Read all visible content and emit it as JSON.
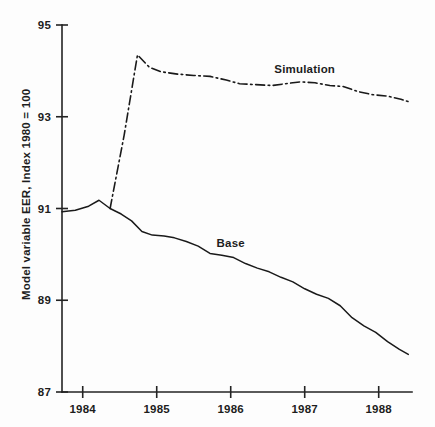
{
  "chart_data": {
    "type": "line",
    "title": "",
    "xlabel": "",
    "ylabel": "Model variable EER, Index 1980 = 100",
    "ylim": [
      87,
      95
    ],
    "xlim": [
      1983.72,
      1988.45
    ],
    "yticks": [
      87,
      89,
      91,
      93,
      95
    ],
    "ytick_labels": [
      "87",
      "89",
      "91",
      "93",
      "95"
    ],
    "xticks": [
      1984,
      1985,
      1986,
      1987,
      1988
    ],
    "xtick_labels": [
      "1984",
      "1985",
      "1986",
      "1987",
      "1988"
    ],
    "grid": false,
    "legend_position": "inline-annotation",
    "series": [
      {
        "name": "Base",
        "style": "solid",
        "label_x": 1986.0,
        "label_y": 90.15,
        "points": [
          [
            1983.72,
            90.93
          ],
          [
            1983.9,
            90.96
          ],
          [
            1984.08,
            91.05
          ],
          [
            1984.22,
            91.18
          ],
          [
            1984.37,
            91.0
          ],
          [
            1984.52,
            90.88
          ],
          [
            1984.66,
            90.73
          ],
          [
            1984.8,
            90.5
          ],
          [
            1984.94,
            90.42
          ],
          [
            1985.1,
            90.4
          ],
          [
            1985.24,
            90.36
          ],
          [
            1985.4,
            90.28
          ],
          [
            1985.56,
            90.18
          ],
          [
            1985.72,
            90.02
          ],
          [
            1985.88,
            89.98
          ],
          [
            1986.04,
            89.93
          ],
          [
            1986.2,
            89.8
          ],
          [
            1986.36,
            89.7
          ],
          [
            1986.52,
            89.62
          ],
          [
            1986.68,
            89.5
          ],
          [
            1986.84,
            89.4
          ],
          [
            1987.0,
            89.25
          ],
          [
            1987.16,
            89.13
          ],
          [
            1987.32,
            89.04
          ],
          [
            1987.48,
            88.88
          ],
          [
            1987.64,
            88.62
          ],
          [
            1987.8,
            88.44
          ],
          [
            1987.96,
            88.3
          ],
          [
            1988.12,
            88.1
          ],
          [
            1988.28,
            87.93
          ],
          [
            1988.4,
            87.82
          ]
        ]
      },
      {
        "name": "Simulation",
        "style": "dash-dot",
        "label_x": 1987.0,
        "label_y": 93.95,
        "points": [
          [
            1984.37,
            91.0
          ],
          [
            1984.56,
            92.6
          ],
          [
            1984.74,
            94.35
          ],
          [
            1984.9,
            94.08
          ],
          [
            1985.06,
            93.98
          ],
          [
            1985.28,
            93.93
          ],
          [
            1985.5,
            93.9
          ],
          [
            1985.72,
            93.88
          ],
          [
            1985.94,
            93.8
          ],
          [
            1986.12,
            93.72
          ],
          [
            1986.34,
            93.7
          ],
          [
            1986.56,
            93.68
          ],
          [
            1986.74,
            93.72
          ],
          [
            1986.94,
            93.76
          ],
          [
            1987.14,
            93.74
          ],
          [
            1987.34,
            93.68
          ],
          [
            1987.52,
            93.66
          ],
          [
            1987.72,
            93.55
          ],
          [
            1987.92,
            93.48
          ],
          [
            1988.12,
            93.45
          ],
          [
            1988.3,
            93.38
          ],
          [
            1988.4,
            93.33
          ]
        ]
      }
    ]
  }
}
